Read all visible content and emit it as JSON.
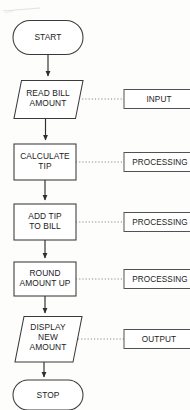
{
  "diagram": {
    "background_color": "#fdfdfb",
    "stroke_color": "#3a3a3a",
    "text_color": "#222222",
    "connector_style": "dotted"
  },
  "nodes": [
    {
      "id": "start",
      "shape": "terminator",
      "label": "START",
      "lines": [
        "START"
      ]
    },
    {
      "id": "read-bill-amount",
      "shape": "parallelogram",
      "label": "READ BILL AMOUNT",
      "lines": [
        "READ BILL",
        "AMOUNT"
      ]
    },
    {
      "id": "calculate-tip",
      "shape": "process",
      "label": "CALCULATE TIP",
      "lines": [
        "CALCULATE",
        "TIP"
      ]
    },
    {
      "id": "add-tip-to-bill",
      "shape": "process",
      "label": "ADD TIP TO BILL",
      "lines": [
        "ADD TIP",
        "TO BILL"
      ]
    },
    {
      "id": "round-amount-up",
      "shape": "process",
      "label": "ROUND AMOUNT UP",
      "lines": [
        "ROUND",
        "AMOUNT UP"
      ]
    },
    {
      "id": "display-new-amount",
      "shape": "parallelogram",
      "label": "DISPLAY NEW AMOUNT",
      "lines": [
        "DISPLAY",
        "NEW",
        "AMOUNT"
      ]
    },
    {
      "id": "stop",
      "shape": "terminator",
      "label": "STOP",
      "lines": [
        "STOP"
      ]
    }
  ],
  "annotations": [
    {
      "id": "input",
      "label": "INPUT",
      "target": "read-bill-amount"
    },
    {
      "id": "processing-1",
      "label": "PROCESSING",
      "target": "calculate-tip"
    },
    {
      "id": "processing-2",
      "label": "PROCESSING",
      "target": "add-tip-to-bill"
    },
    {
      "id": "processing-3",
      "label": "PROCESSING",
      "target": "round-amount-up"
    },
    {
      "id": "output",
      "label": "OUTPUT",
      "target": "display-new-amount"
    }
  ],
  "flow_sequence": [
    "START",
    "READ BILL AMOUNT",
    "CALCULATE TIP",
    "ADD TIP TO BILL",
    "ROUND AMOUNT UP",
    "DISPLAY NEW AMOUNT",
    "STOP"
  ]
}
